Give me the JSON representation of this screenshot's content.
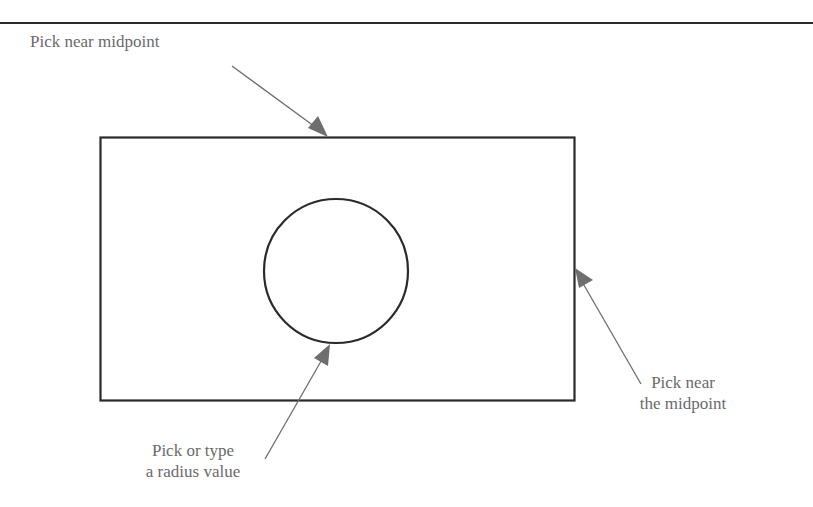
{
  "diagram": {
    "type": "annotated-geometry-figure",
    "shapes": {
      "rectangle": {
        "x": 100,
        "y": 137,
        "width": 474,
        "height": 263,
        "stroke": "#2a2a2a"
      },
      "circle": {
        "cx": 336,
        "cy": 271,
        "r": 72,
        "stroke": "#2a2a2a"
      },
      "top_rule": {
        "y": 23,
        "color": "#2a2a2a"
      }
    },
    "callouts": [
      {
        "id": "top",
        "lines": [
          "Pick near midpoint"
        ],
        "arrow": {
          "from": [
            232,
            66
          ],
          "to": [
            328,
            137
          ]
        }
      },
      {
        "id": "bottom",
        "lines": [
          "Pick or type",
          "a radius value"
        ],
        "arrow": {
          "from": [
            265,
            459
          ],
          "to": [
            330,
            344
          ]
        }
      },
      {
        "id": "right",
        "lines": [
          "Pick near",
          "the midpoint"
        ],
        "arrow": {
          "from": [
            641,
            384
          ],
          "to": [
            575,
            268
          ]
        }
      }
    ],
    "colors": {
      "line": "#2a2a2a",
      "arrow": "#6e6e6e",
      "text": "#6a6a6a",
      "background": "#ffffff"
    }
  }
}
